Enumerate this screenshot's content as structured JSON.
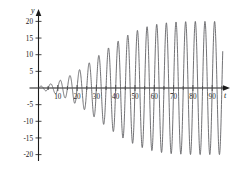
{
  "chart_data": {
    "type": "line",
    "title": "",
    "xlabel": "t",
    "ylabel": "y",
    "xlim": [
      -4,
      97
    ],
    "ylim": [
      -22,
      22
    ],
    "grid": false,
    "legend": null,
    "xticks": [
      10,
      20,
      30,
      40,
      50,
      60,
      70,
      80,
      90
    ],
    "xticklabels": [
      "10",
      "20",
      "30",
      "40",
      "50",
      "60",
      "70",
      "80",
      "90"
    ],
    "xminor_step": 5,
    "yticks": [
      -20,
      -15,
      -10,
      -5,
      5,
      10,
      15,
      20
    ],
    "yticklabels": [
      "-20",
      "-15",
      "-10",
      "-5",
      "5",
      "10",
      "15",
      "20"
    ],
    "series": [
      {
        "name": "y(t)",
        "color": "#58585c",
        "period": 5,
        "amplitude_max": 20,
        "envelope": "growing then saturating at 20",
        "x": [
          0,
          5,
          10,
          15,
          20,
          25,
          30,
          35,
          40,
          45,
          50,
          55,
          60,
          65,
          70,
          75,
          80,
          85,
          90,
          95
        ],
        "peak_values": [
          0.4,
          1.0,
          2.0,
          3.3,
          5.0,
          7.0,
          9.2,
          11.5,
          13.6,
          15.5,
          17.0,
          18.2,
          19.0,
          19.5,
          19.8,
          19.9,
          20.0,
          20.0,
          20.0,
          20.0
        ],
        "trough_values": [
          -0.4,
          -1.0,
          -2.0,
          -3.3,
          -5.0,
          -7.0,
          -9.2,
          -11.5,
          -13.6,
          -15.5,
          -17.0,
          -18.2,
          -19.0,
          -19.5,
          -19.8,
          -19.9,
          -20.0,
          -20.0,
          -20.0,
          -20.0
        ]
      }
    ]
  },
  "axis": {
    "y_label": "y",
    "t_label": "t"
  }
}
